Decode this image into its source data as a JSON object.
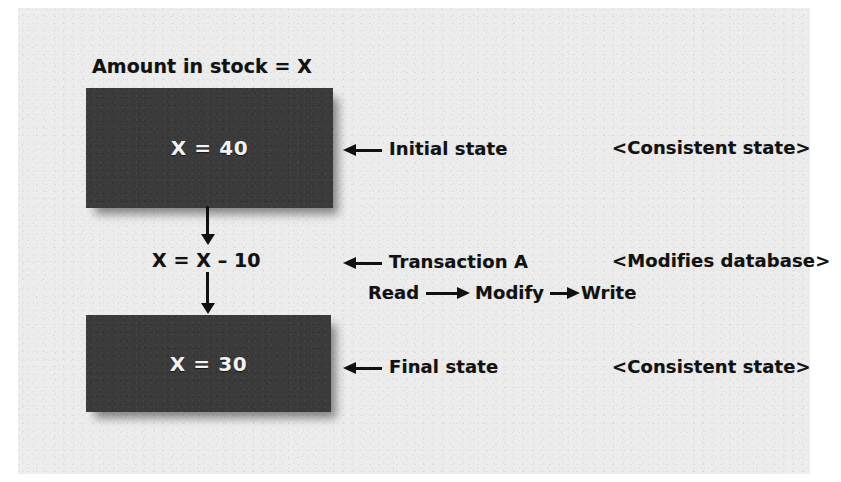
{
  "figure": {
    "heading": "Amount in stock = X",
    "expression": "X = X – 10"
  },
  "states": {
    "initial": {
      "value": "X = 40",
      "callout": "Initial state",
      "note": "<Consistent state>"
    },
    "final": {
      "value": "X = 30",
      "callout": "Final state",
      "note": "<Consistent state>"
    }
  },
  "transaction": {
    "callout": "Transaction A",
    "note": "<Modifies database>",
    "steps": [
      "Read",
      "Modify",
      "Write"
    ]
  },
  "colors": {
    "box_fill": "#3b3b3b",
    "box_text": "#f2f2f2",
    "ink": "#121212",
    "paper": "#ececec"
  }
}
